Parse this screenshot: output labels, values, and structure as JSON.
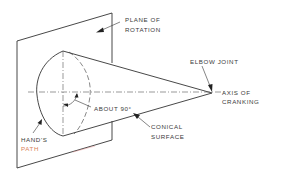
{
  "figure": {
    "type": "technical-line-drawing"
  },
  "labels": {
    "plane_of_rotation": [
      "PLANE OF",
      "ROTATION"
    ],
    "elbow_joint": "ELBOW JOINT",
    "axis_of_cranking": [
      "AXIS OF",
      "CRANKING"
    ],
    "about_90": "ABOUT 90°",
    "conical_surface": [
      "CONICAL",
      "SURFACE"
    ],
    "hands_path": [
      "HAND'S",
      "PATH"
    ]
  },
  "colors": {
    "line": "#333333",
    "text": "#3a3a3a",
    "background": "#ffffff",
    "path_label_accent": "#d9825b"
  }
}
